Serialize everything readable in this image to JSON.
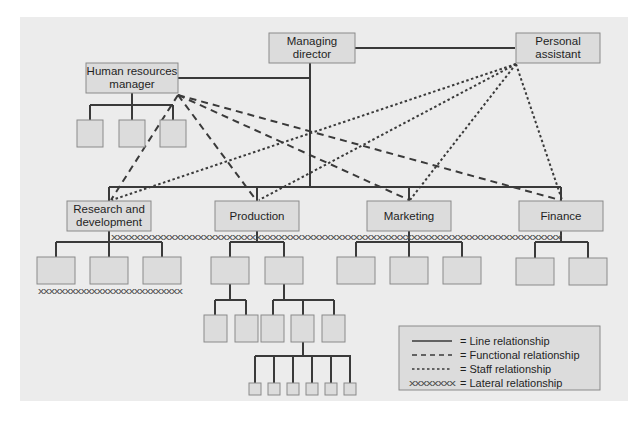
{
  "diagram": {
    "title": "",
    "colors": {
      "panel": "#ececec",
      "box_fill": "#dcdcdc",
      "box_stroke": "#8a8a8a",
      "line": "#3a3a3a"
    },
    "nodes": {
      "md": {
        "line1": "Managing",
        "line2": "director"
      },
      "pa": {
        "line1": "Personal",
        "line2": "assistant"
      },
      "hr": {
        "line1": "Human resources",
        "line2": "manager"
      },
      "rd": {
        "line1": "Research and",
        "line2": "development"
      },
      "prod": {
        "label": "Production"
      },
      "mkt": {
        "label": "Marketing"
      },
      "fin": {
        "label": "Finance"
      }
    },
    "lateral": {
      "dept_row": "xxxxxxxxxxxxxxxxxxxxxxxxxxxxxxxxxxxxxxxxxxxxxxxxxxxxxxxxxxxxxxxxxxxxxxxxxxxxxx",
      "rd_row": "xxxxxxxxxxxxxxxxxxxxxxxxxxx"
    },
    "legend": {
      "items": [
        {
          "symbol": "solid",
          "label": "= Line relationship"
        },
        {
          "symbol": "dashed",
          "label": "= Functional relationship"
        },
        {
          "symbol": "dotted",
          "label": "= Staff relationship"
        },
        {
          "symbol": "xxxxxxxx",
          "label": "= Lateral relationship"
        }
      ]
    }
  }
}
